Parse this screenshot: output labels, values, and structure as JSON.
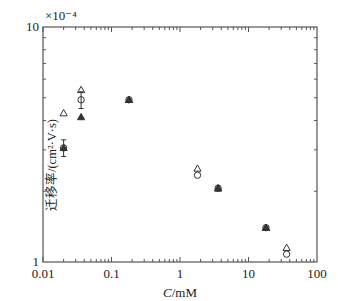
{
  "chart_data": {
    "type": "scatter",
    "title": "",
    "xlabel": "C/mM",
    "xlabel_italic_part": "C",
    "xlabel_rest": "/mM",
    "ylabel": "迁移率/(cm²·V·s)",
    "y_multiplier": "×10⁻⁴",
    "xscale": "log",
    "yscale": "log",
    "xlim": [
      0.01,
      100
    ],
    "ylim": [
      1,
      10
    ],
    "x_ticks": [
      "0.01",
      "0.1",
      "1",
      "10",
      "100"
    ],
    "y_ticks": [
      "1",
      "10"
    ],
    "grid": false,
    "legend": "none",
    "series": [
      {
        "name": "open-triangle",
        "marker": "triangle-open",
        "points": [
          {
            "x": 0.02,
            "y": 4.3
          },
          {
            "x": 0.036,
            "y": 5.4
          },
          {
            "x": 0.18,
            "y": 4.9
          },
          {
            "x": 1.8,
            "y": 2.5
          },
          {
            "x": 3.6,
            "y": 2.06
          },
          {
            "x": 18,
            "y": 1.4
          },
          {
            "x": 36,
            "y": 1.15
          }
        ]
      },
      {
        "name": "open-circle",
        "marker": "circle-open",
        "points": [
          {
            "x": 0.02,
            "y": 3.06,
            "err": 0.25
          },
          {
            "x": 0.036,
            "y": 4.9,
            "err": 0.4
          },
          {
            "x": 0.18,
            "y": 4.9
          },
          {
            "x": 1.8,
            "y": 2.34
          },
          {
            "x": 3.6,
            "y": 2.06
          },
          {
            "x": 18,
            "y": 1.4
          },
          {
            "x": 36,
            "y": 1.08
          }
        ]
      },
      {
        "name": "filled-triangle",
        "marker": "triangle-filled",
        "points": [
          {
            "x": 0.02,
            "y": 3.06
          },
          {
            "x": 0.036,
            "y": 4.14
          },
          {
            "x": 0.18,
            "y": 4.9
          },
          {
            "x": 3.6,
            "y": 2.06
          },
          {
            "x": 18,
            "y": 1.4
          }
        ]
      }
    ]
  },
  "colors": {
    "axis": "#555555",
    "marker": "#333333"
  }
}
